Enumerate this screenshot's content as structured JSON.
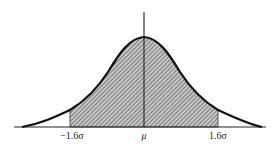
{
  "figure": {
    "labels": {
      "left": "−1.6σ",
      "center": "μ",
      "right": "1.6σ"
    },
    "colors": {
      "curve": "#111111",
      "hatch": "#555555",
      "fill": "#bdbdbd",
      "axis": "#222222"
    },
    "shaded_range": [
      "-1.6σ",
      "1.6σ"
    ]
  }
}
